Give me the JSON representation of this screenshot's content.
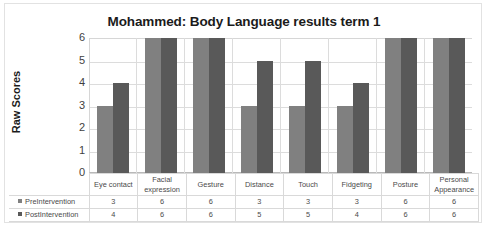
{
  "chart_data": {
    "type": "bar",
    "title": "Mohammed: Body Language results term 1",
    "xlabel": "",
    "ylabel": "Raw Scores",
    "ylim": [
      0,
      6
    ],
    "yticks": [
      6,
      5,
      4,
      3,
      2,
      1,
      0
    ],
    "grid": true,
    "legend_position": "data-table",
    "categories": [
      "Eye contact",
      "Facial expression",
      "Gesture",
      "Distance",
      "Touch",
      "Fidgeting",
      "Posture",
      "Personal Appearance"
    ],
    "series": [
      {
        "name": "PreIntervention",
        "color": "#808080",
        "values": [
          3,
          6,
          6,
          3,
          3,
          3,
          6,
          6
        ]
      },
      {
        "name": "PostIntervention",
        "color": "#595959",
        "values": [
          4,
          6,
          6,
          5,
          5,
          4,
          6,
          6
        ]
      }
    ]
  }
}
